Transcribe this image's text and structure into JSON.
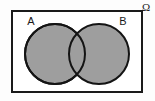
{
  "figure": {
    "type": "venn-diagram",
    "title": ""
  },
  "universal_set": {
    "label": "Ω",
    "label_name": "omega-symbol",
    "border_color": "#1a1a1a",
    "fill_color": "#ffffff",
    "border_width_px": 2,
    "x": 11,
    "y": 10,
    "width": 132,
    "height": 83
  },
  "sets": [
    {
      "label": "A",
      "cx": 55,
      "cy": 54,
      "r": 30,
      "shaded": true,
      "fill_color": "#9e9e9e",
      "stroke_color": "#141414",
      "label_x": 31,
      "label_y": 24
    },
    {
      "label": "B",
      "cx": 99,
      "cy": 54,
      "r": 30,
      "shaded": true,
      "fill_color": "#9e9e9e",
      "stroke_color": "#141414",
      "label_x": 122,
      "label_y": 24
    }
  ],
  "shading": {
    "region": "A union B",
    "color": "#9e9e9e",
    "intersection_color": "#9e9e9e"
  },
  "colors": {
    "shade": "#9e9e9e",
    "outline": "#141414",
    "frame": "#1a1a1a",
    "background": "#fdfdfd",
    "inner_background": "#ffffff"
  }
}
